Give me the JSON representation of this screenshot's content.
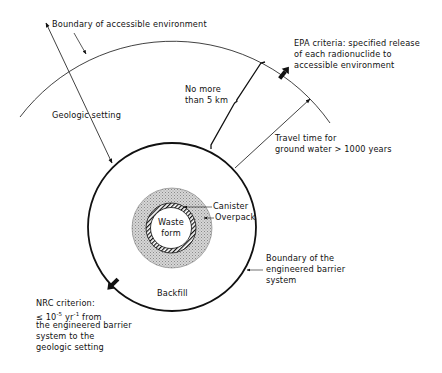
{
  "diagram": {
    "type": "concentric-barrier-schematic",
    "colors": {
      "line": "#111111",
      "overpack_fill": "#c8c8c8",
      "background": "#ffffff"
    },
    "labels": {
      "accessible_boundary": "Boundary of accessible environment",
      "geologic_setting": "Geologic setting",
      "distance": [
        "No more",
        "than 5 km"
      ],
      "epa": [
        "EPA criteria: specified release",
        "of each radionuclide to",
        "accessible environment"
      ],
      "travel_time": [
        "Travel time for",
        "ground water > 1000 years"
      ],
      "canister": "Canister",
      "overpack": "Overpack",
      "waste_form": [
        "Waste",
        "form"
      ],
      "ebs_boundary": [
        "Boundary of the",
        "engineered barrier",
        "system"
      ],
      "backfill": "Backfill",
      "nrc": {
        "title": "NRC criterion:",
        "rate_prefix": "≤ 10",
        "rate_exp1": "-5",
        "rate_mid": " yr",
        "rate_exp2": "-1",
        "rate_suffix": " from",
        "rest": [
          "the engineered barrier",
          "system to the",
          "geologic setting"
        ]
      }
    }
  }
}
